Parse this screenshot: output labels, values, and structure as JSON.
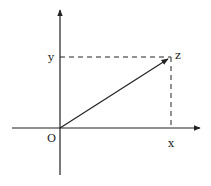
{
  "diagram": {
    "type": "cartesian-projection",
    "labels": {
      "origin": "O",
      "x_label": "x",
      "y_label": "y",
      "point_label": "z"
    },
    "colors": {
      "ink": "#222222",
      "background": "#ffffff"
    },
    "geometry": {
      "origin": [
        60,
        128
      ],
      "point": [
        171,
        57
      ],
      "x_axis": {
        "from": [
          12,
          128
        ],
        "to": [
          200,
          128
        ]
      },
      "y_axis": {
        "from": [
          60,
          175
        ],
        "to": [
          60,
          10
        ]
      }
    }
  }
}
